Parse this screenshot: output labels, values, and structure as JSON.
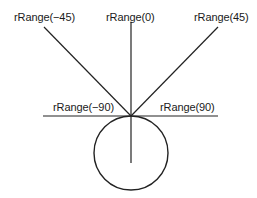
{
  "diagram": {
    "type": "angle-range-diagram",
    "stroke_color": "#222222",
    "labels": {
      "neg45": "rRange(−45)",
      "zero": "rRange(0)",
      "pos45": "rRange(45)",
      "neg90": "rRange(−90)",
      "pos90": "rRange(90)"
    },
    "rays": [
      {
        "angle": -45,
        "label": "rRange(−45)"
      },
      {
        "angle": 0,
        "label": "rRange(0)"
      },
      {
        "angle": 45,
        "label": "rRange(45)"
      },
      {
        "angle": -90,
        "label": "rRange(−90)"
      },
      {
        "angle": 90,
        "label": "rRange(90)"
      }
    ],
    "circle": {
      "shape": "circle",
      "tangent_to": "horizontal line at origin"
    }
  }
}
